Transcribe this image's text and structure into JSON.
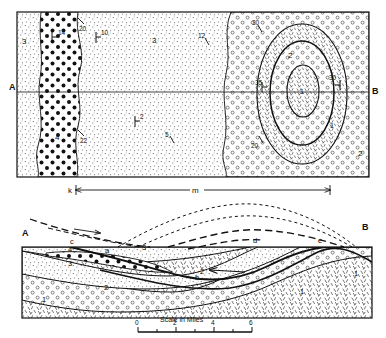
{
  "figure": {
    "type": "geologic-map-and-cross-section",
    "scale_bar": {
      "title": "Scale in Miles",
      "ticks": [
        "0",
        "2",
        "4",
        "6"
      ],
      "minor_ticks": 6
    },
    "dimension_line": {
      "left_label": "k",
      "center_label": "m",
      "right_label": ""
    }
  },
  "map": {
    "section_line": {
      "left_end": "A",
      "right_end": "B"
    },
    "unit_labels": [
      {
        "id": "u3-left",
        "text": "3"
      },
      {
        "id": "u4-west",
        "text": "4"
      },
      {
        "id": "u3-mid",
        "text": "3"
      },
      {
        "id": "u2-mid",
        "text": "2"
      },
      {
        "id": "u2-east",
        "text": "2"
      },
      {
        "id": "u2-dome",
        "text": "2"
      },
      {
        "id": "u1-core",
        "text": "1"
      },
      {
        "id": "u1-ring",
        "text": "1"
      }
    ],
    "dip_symbols": [
      {
        "id": "dip-14",
        "text": "14"
      },
      {
        "id": "dip-20-n",
        "text": "20"
      },
      {
        "id": "dip-10",
        "text": "10"
      },
      {
        "id": "dip-12",
        "text": "12"
      },
      {
        "id": "dip-22",
        "text": "22"
      },
      {
        "id": "dip-5",
        "text": "5"
      },
      {
        "id": "dip-2",
        "text": "2"
      },
      {
        "id": "dip-30-n",
        "text": "30"
      },
      {
        "id": "dip-35",
        "text": "35"
      },
      {
        "id": "dip-30-e",
        "text": "30"
      },
      {
        "id": "dip-20-s",
        "text": "20"
      }
    ]
  },
  "section": {
    "left_end": "A",
    "right_end": "B",
    "point_labels": [
      {
        "id": "pt-c",
        "text": "c"
      },
      {
        "id": "pt-a",
        "text": "a"
      },
      {
        "id": "pt-b",
        "text": "b"
      },
      {
        "id": "pt-d",
        "text": "d"
      },
      {
        "id": "pt-e",
        "text": "e"
      }
    ],
    "unit_labels": [
      {
        "id": "s4",
        "text": "4"
      },
      {
        "id": "s3a",
        "text": "3"
      },
      {
        "id": "s3b",
        "text": "3"
      },
      {
        "id": "s2a",
        "text": "2"
      },
      {
        "id": "s2b",
        "text": "2"
      },
      {
        "id": "s1a",
        "text": "1"
      },
      {
        "id": "s1b",
        "text": "1"
      },
      {
        "id": "s1c",
        "text": "1"
      }
    ]
  },
  "colors": {
    "ink": "#111111",
    "line": "#1a1a1a",
    "paper": "#ffffff",
    "stipple": "#4a4a4a"
  }
}
